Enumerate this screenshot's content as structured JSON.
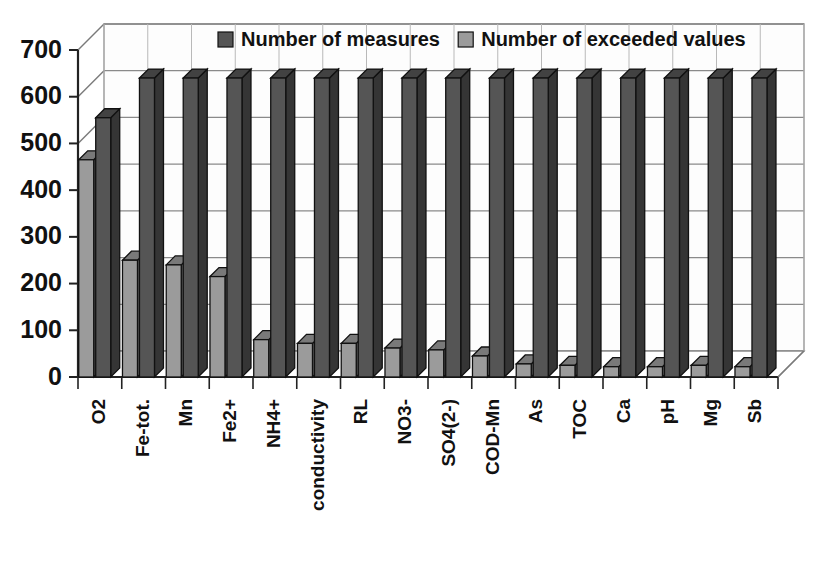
{
  "chart_data": {
    "type": "bar",
    "title": "",
    "subtitle": "",
    "xlabel": "",
    "ylabel": "",
    "ylim": [
      0,
      700
    ],
    "ytick_step": 100,
    "yticks": [
      "0",
      "100",
      "200",
      "300",
      "400",
      "500",
      "600",
      "700"
    ],
    "grid": true,
    "three_d": true,
    "legend_position": "top-center",
    "categories": [
      "O2",
      "Fe-tot.",
      "Mn",
      "Fe2+",
      "NH4+",
      "conductivity",
      "RL",
      "NO3-",
      "SO4(2-)",
      "COD-Mn",
      "As",
      "TOC",
      "Ca",
      "pH",
      "Mg",
      "Sb"
    ],
    "series": [
      {
        "name": "Number of exceeded values",
        "color": "#9b9b9b",
        "values": [
          465,
          250,
          240,
          215,
          80,
          72,
          72,
          62,
          58,
          45,
          28,
          25,
          22,
          22,
          25,
          22
        ]
      },
      {
        "name": "Number of measures",
        "color": "#555555",
        "values": [
          555,
          640,
          640,
          640,
          640,
          640,
          640,
          640,
          640,
          640,
          640,
          640,
          640,
          640,
          640,
          640
        ]
      }
    ]
  },
  "legend": {
    "entries": [
      {
        "label": "Number of measures",
        "color": "#555555"
      },
      {
        "label": "Number of exceeded values",
        "color": "#9b9b9b"
      }
    ]
  },
  "colors": {
    "series_measures": "#555555",
    "series_exceeded": "#9b9b9b",
    "axis": "#222222",
    "grid": "#8a8a8a",
    "background": "#ffffff"
  }
}
